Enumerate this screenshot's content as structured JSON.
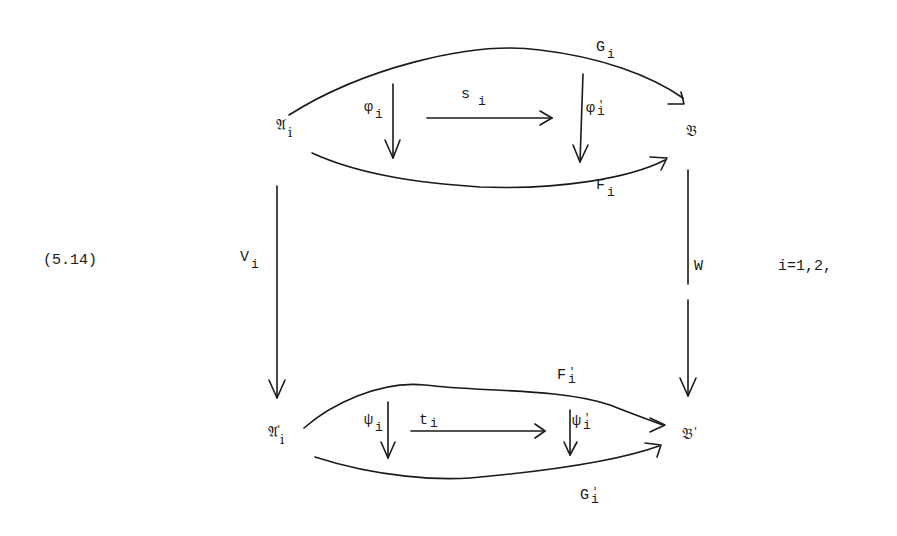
{
  "equation": {
    "number": "(5.14)",
    "condition": "i=1,2,"
  },
  "nodes": {
    "A_i": {
      "main": "𝔄",
      "sub": "i",
      "prime": ""
    },
    "B": {
      "main": "𝔅",
      "sub": "",
      "prime": ""
    },
    "A_i_prime": {
      "main": "𝔄",
      "sub": "i",
      "prime": "'"
    },
    "B_prime": {
      "main": "𝔅",
      "sub": "",
      "prime": "'"
    }
  },
  "morphisms": {
    "G_i": {
      "main": "G",
      "sub": "i",
      "prime": ""
    },
    "F_i": {
      "main": "F",
      "sub": "i",
      "prime": ""
    },
    "phi_i": {
      "main": "φ",
      "sub": "i",
      "prime": ""
    },
    "phi_i_prime": {
      "main": "φ",
      "sub": "i",
      "prime": "'"
    },
    "s_i": {
      "main": "s",
      "sub": "i",
      "prime": ""
    },
    "V_i": {
      "main": "V",
      "sub": "i",
      "prime": ""
    },
    "W": {
      "main": "W",
      "sub": "",
      "prime": ""
    },
    "F_i_prime": {
      "main": "F",
      "sub": "i",
      "prime": "'"
    },
    "G_i_prime": {
      "main": "G",
      "sub": "i",
      "prime": "'"
    },
    "psi_i": {
      "main": "ψ",
      "sub": "i",
      "prime": ""
    },
    "psi_i_prime": {
      "main": "ψ",
      "sub": "i",
      "prime": "'"
    },
    "t_i": {
      "main": "t",
      "sub": "i",
      "prime": ""
    }
  }
}
